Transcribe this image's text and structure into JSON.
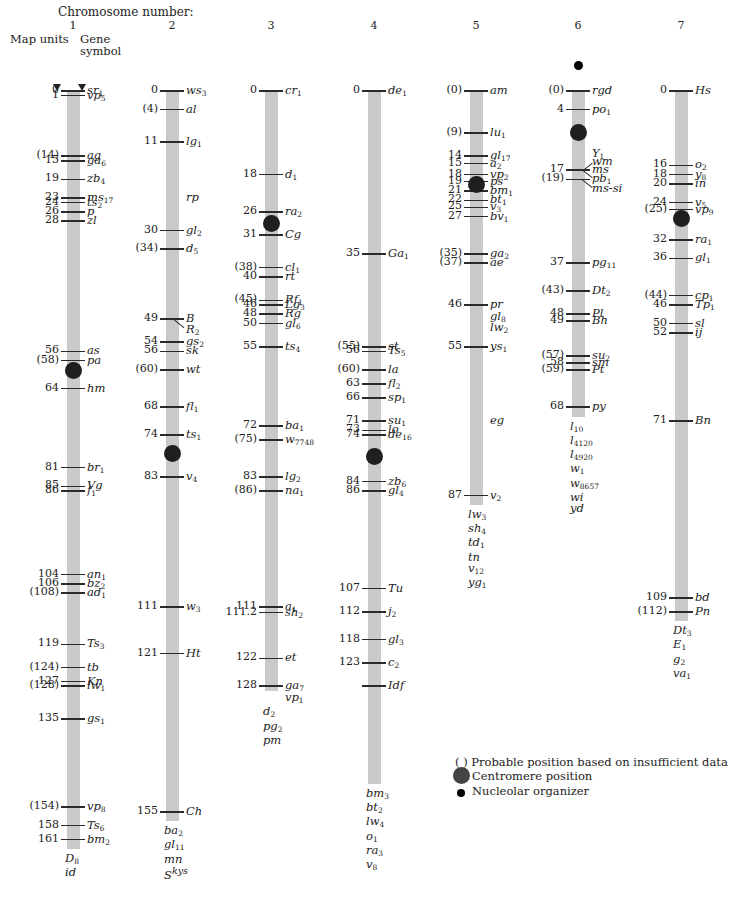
{
  "title": "Chromosome number:",
  "header": {
    "map_units": "Map units",
    "gene_symbol": "Gene symbol"
  },
  "scale": {
    "top_px": 91,
    "px_per_unit": 4.65
  },
  "chromosomes": [
    {
      "number": "1",
      "x": 73,
      "length": 163,
      "centromere": 60,
      "tail_genes": [
        "D|8",
        "id"
      ],
      "loci": [
        {
          "pos": "0",
          "u": 0,
          "gene": "sr|1"
        },
        {
          "pos": "1",
          "u": 1,
          "gene": "vp|5"
        },
        {
          "pos": "(14)",
          "u": 14,
          "gene": "ag"
        },
        {
          "pos": "15",
          "u": 15,
          "gene": "ga|6"
        },
        {
          "pos": "19",
          "u": 19,
          "gene": "zb|4"
        },
        {
          "pos": "23",
          "u": 23,
          "gene": "ms|17"
        },
        {
          "pos": "24",
          "u": 24,
          "gene": "ts|2"
        },
        {
          "pos": "26",
          "u": 26,
          "gene": "p"
        },
        {
          "pos": "28",
          "u": 28,
          "gene": "zl"
        },
        {
          "pos": "56",
          "u": 56,
          "gene": "as"
        },
        {
          "pos": "(58)",
          "u": 58,
          "gene": "pa"
        },
        {
          "pos": "64",
          "u": 64,
          "gene": "hm"
        },
        {
          "pos": "81",
          "u": 81,
          "gene": "br|1"
        },
        {
          "pos": "85",
          "u": 85,
          "gene": "Vg"
        },
        {
          "pos": "86",
          "u": 86,
          "gene": "f|1"
        },
        {
          "pos": "104",
          "u": 104,
          "gene": "an|1"
        },
        {
          "pos": "106",
          "u": 106,
          "gene": "bz|2"
        },
        {
          "pos": "(108)",
          "u": 108,
          "gene": "ad|1"
        },
        {
          "pos": "119",
          "u": 119,
          "gene": "Ts|3"
        },
        {
          "pos": "(124)",
          "u": 124,
          "gene": "tb"
        },
        {
          "pos": "127",
          "u": 127,
          "gene": "Kn"
        },
        {
          "pos": "(128)",
          "u": 128,
          "gene": "lw|1"
        },
        {
          "pos": "135",
          "u": 135,
          "gene": "gs|1"
        },
        {
          "pos": "(154)",
          "u": 154,
          "gene": "vp|8"
        },
        {
          "pos": "158",
          "u": 158,
          "gene": "Ts|6"
        },
        {
          "pos": "161",
          "u": 161,
          "gene": "bm|2"
        }
      ]
    },
    {
      "number": "2",
      "x": 172,
      "length": 157,
      "centromere": 78,
      "tail_genes": [
        "ba|2",
        "gl|11",
        "mn",
        "S^kys"
      ],
      "loci": [
        {
          "pos": "0",
          "u": 0,
          "gene": "ws|3"
        },
        {
          "pos": "(4)",
          "u": 4,
          "gene": "al"
        },
        {
          "pos": "11",
          "u": 11,
          "gene": "lg|1"
        },
        {
          "pos": "",
          "u": 23,
          "gene": "rp",
          "notick": true
        },
        {
          "pos": "30",
          "u": 30,
          "gene": "gl|2"
        },
        {
          "pos": "(34)",
          "u": 34,
          "gene": "d|5"
        },
        {
          "pos": "49",
          "u": 49,
          "gene": "B"
        },
        {
          "pos": "",
          "u": 51.5,
          "gene": "R|2",
          "notick": true,
          "diag": true
        },
        {
          "pos": "54",
          "u": 54,
          "gene": "gs|2"
        },
        {
          "pos": "56",
          "u": 56,
          "gene": "sk"
        },
        {
          "pos": "(60)",
          "u": 60,
          "gene": "wt"
        },
        {
          "pos": "68",
          "u": 68,
          "gene": "fl|1"
        },
        {
          "pos": "74",
          "u": 74,
          "gene": "ts|1"
        },
        {
          "pos": "83",
          "u": 83,
          "gene": "v|4"
        },
        {
          "pos": "111",
          "u": 111,
          "gene": "w|3"
        },
        {
          "pos": "121",
          "u": 121,
          "gene": "Ht"
        },
        {
          "pos": "155",
          "u": 155,
          "gene": "Ch"
        }
      ]
    },
    {
      "number": "3",
      "x": 271,
      "length": 129,
      "centromere": 28.5,
      "tail_genes": [
        "vp|1",
        "d|2",
        "pg|2",
        "pm"
      ],
      "loci": [
        {
          "pos": "0",
          "u": 0,
          "gene": "cr|1"
        },
        {
          "pos": "18",
          "u": 18,
          "gene": "d|1"
        },
        {
          "pos": "26",
          "u": 26,
          "gene": "ra|2"
        },
        {
          "pos": "31",
          "u": 31,
          "gene": "Cg"
        },
        {
          "pos": "(38)",
          "u": 38,
          "gene": "cl|1"
        },
        {
          "pos": "40",
          "u": 40,
          "gene": "rt"
        },
        {
          "pos": "(45)",
          "u": 45,
          "gene": "Rf|1"
        },
        {
          "pos": "46",
          "u": 46,
          "gene": "Lg|3"
        },
        {
          "pos": "48",
          "u": 48,
          "gene": "Rg"
        },
        {
          "pos": "50",
          "u": 50,
          "gene": "gl|6"
        },
        {
          "pos": "55",
          "u": 55,
          "gene": "ts|4"
        },
        {
          "pos": "72",
          "u": 72,
          "gene": "ba|1"
        },
        {
          "pos": "(75)",
          "u": 75,
          "gene": "w|7748"
        },
        {
          "pos": "83",
          "u": 83,
          "gene": "lg|2"
        },
        {
          "pos": "(86)",
          "u": 86,
          "gene": "na|1"
        },
        {
          "pos": "111",
          "u": 111,
          "gene": "a|1"
        },
        {
          "pos": "111.2",
          "u": 112.2,
          "gene": "sh|2"
        },
        {
          "pos": "122",
          "u": 122,
          "gene": "et"
        },
        {
          "pos": "128",
          "u": 128,
          "gene": "ga|7"
        }
      ]
    },
    {
      "number": "4",
      "x": 374,
      "length": 149,
      "centromere": 78.5,
      "tail_genes": [
        "bm|3",
        "bt|2",
        "lw|4",
        "o|1",
        "ra|3",
        "v|8"
      ],
      "loci": [
        {
          "pos": "0",
          "u": 0,
          "gene": "de|1"
        },
        {
          "pos": "35",
          "u": 35,
          "gene": "Ga|1"
        },
        {
          "pos": "(55)",
          "u": 55,
          "gene": "st"
        },
        {
          "pos": "56",
          "u": 56,
          "gene": "Ts|5"
        },
        {
          "pos": "(60)",
          "u": 60,
          "gene": "la"
        },
        {
          "pos": "63",
          "u": 63,
          "gene": "fl|2"
        },
        {
          "pos": "66",
          "u": 66,
          "gene": "sp|1"
        },
        {
          "pos": "71",
          "u": 71,
          "gene": "su|1"
        },
        {
          "pos": "73",
          "u": 73,
          "gene": "lo"
        },
        {
          "pos": "74",
          "u": 74,
          "gene": "de|16"
        },
        {
          "pos": "84",
          "u": 84,
          "gene": "zb|6"
        },
        {
          "pos": "86",
          "u": 86,
          "gene": "gl|4"
        },
        {
          "pos": "107",
          "u": 107,
          "gene": "Tu"
        },
        {
          "pos": "112",
          "u": 112,
          "gene": "j|2"
        },
        {
          "pos": "118",
          "u": 118,
          "gene": "gl|3"
        },
        {
          "pos": "123",
          "u": 123,
          "gene": "c|2"
        },
        {
          "pos": "",
          "u": 128,
          "gene": "Idf"
        }
      ]
    },
    {
      "number": "5",
      "x": 476,
      "length": 89,
      "centromere": 20,
      "tail_genes": [
        "lw|3",
        "sh|4",
        "td|1",
        "tn",
        "v|12",
        "yg|1"
      ],
      "loci": [
        {
          "pos": "(0)",
          "u": 0,
          "gene": "am"
        },
        {
          "pos": "(9)",
          "u": 9,
          "gene": "lu|1"
        },
        {
          "pos": "14",
          "u": 14,
          "gene": "gl|17"
        },
        {
          "pos": "15",
          "u": 15.6,
          "gene": "a|2"
        },
        {
          "pos": "18",
          "u": 18,
          "gene": "vp|2"
        },
        {
          "pos": "19",
          "u": 19.5,
          "gene": "ps"
        },
        {
          "pos": "21",
          "u": 21.5,
          "gene": "bm|1"
        },
        {
          "pos": "22",
          "u": 23.5,
          "gene": "bt|1"
        },
        {
          "pos": "25",
          "u": 25,
          "gene": "v|3"
        },
        {
          "pos": "27",
          "u": 27,
          "gene": "bv|1"
        },
        {
          "pos": "(35)",
          "u": 35,
          "gene": "ga|2"
        },
        {
          "pos": "(37)",
          "u": 37,
          "gene": "ae"
        },
        {
          "pos": "46",
          "u": 46,
          "gene": "pr"
        },
        {
          "pos": "",
          "u": 48.5,
          "gene": "gl|8",
          "notick": true
        },
        {
          "pos": "",
          "u": 51,
          "gene": "lw|2",
          "notick": true
        },
        {
          "pos": "55",
          "u": 55,
          "gene": "ys|1"
        },
        {
          "pos": "",
          "u": 71,
          "gene": "eg",
          "notick": true
        },
        {
          "pos": "87",
          "u": 87,
          "gene": "v|2"
        }
      ]
    },
    {
      "number": "6",
      "x": 578,
      "length": 70,
      "centromere": 9,
      "nucleolar": -5.5,
      "tail_genes": [
        "l|10",
        "l|4120",
        "l|4920",
        "w|1",
        "w|8657",
        "wi",
        "yd"
      ],
      "loci": [
        {
          "pos": "(0)",
          "u": 0,
          "gene": "rgd"
        },
        {
          "pos": "4",
          "u": 4,
          "gene": "po|1"
        },
        {
          "pos": "",
          "u": 13.5,
          "gene": "Y|1",
          "notick": true
        },
        {
          "pos": "",
          "u": 15.3,
          "gene": "wm",
          "notick": true
        },
        {
          "pos": "17",
          "u": 17,
          "gene": "ms"
        },
        {
          "pos": "(19)",
          "u": 19,
          "gene": "pb|1"
        },
        {
          "pos": "",
          "u": 21,
          "gene": "ms-si",
          "notick": true
        },
        {
          "pos": "37",
          "u": 37,
          "gene": "pg|11"
        },
        {
          "pos": "(43)",
          "u": 43,
          "gene": "Dt|2"
        },
        {
          "pos": "48",
          "u": 48,
          "gene": "Pl"
        },
        {
          "pos": "49",
          "u": 49.5,
          "gene": "Bh"
        },
        {
          "pos": "(57)",
          "u": 57,
          "gene": "su|2"
        },
        {
          "pos": "58",
          "u": 58.5,
          "gene": "sm"
        },
        {
          "pos": "(59)",
          "u": 60,
          "gene": "Pt"
        },
        {
          "pos": "68",
          "u": 68,
          "gene": "py"
        }
      ]
    },
    {
      "number": "7",
      "x": 681,
      "length": 114,
      "centromere": 27.5,
      "tail_genes": [
        "Dt|3",
        "E|1",
        "g|2",
        "va|1"
      ],
      "loci": [
        {
          "pos": "0",
          "u": 0,
          "gene": "Hs"
        },
        {
          "pos": "16",
          "u": 16,
          "gene": "o|2"
        },
        {
          "pos": "18",
          "u": 18,
          "gene": "y|8"
        },
        {
          "pos": "20",
          "u": 20,
          "gene": "in"
        },
        {
          "pos": "24",
          "u": 24,
          "gene": "v|5"
        },
        {
          "pos": "(25)",
          "u": 25.5,
          "gene": "vp|9"
        },
        {
          "pos": "32",
          "u": 32,
          "gene": "ra|1"
        },
        {
          "pos": "36",
          "u": 36,
          "gene": "gl|1"
        },
        {
          "pos": "(44)",
          "u": 44,
          "gene": "cp|1"
        },
        {
          "pos": "46",
          "u": 46,
          "gene": "Tp|1"
        },
        {
          "pos": "50",
          "u": 50,
          "gene": "sl"
        },
        {
          "pos": "52",
          "u": 52,
          "gene": "ij"
        },
        {
          "pos": "71",
          "u": 71,
          "gene": "Bn"
        },
        {
          "pos": "109",
          "u": 109,
          "gene": "bd"
        },
        {
          "pos": "(112)",
          "u": 112,
          "gene": "Pn"
        }
      ]
    }
  ],
  "legend": {
    "paren_symbol": "( )",
    "probable": "Probable position based on insufficient data",
    "centromere": "Centromere position",
    "nucleolar": "Nucleolar organizer"
  }
}
